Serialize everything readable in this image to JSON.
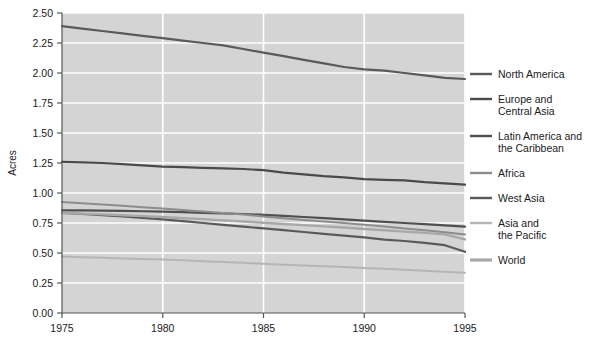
{
  "chart_data": {
    "type": "line",
    "title": "",
    "xlabel": "",
    "ylabel": "Acres",
    "xlim": [
      1975,
      1995
    ],
    "ylim": [
      0.0,
      2.5
    ],
    "grid": true,
    "legend_position": "right",
    "x": [
      1975,
      1976,
      1977,
      1978,
      1979,
      1980,
      1981,
      1982,
      1983,
      1984,
      1985,
      1986,
      1987,
      1988,
      1989,
      1990,
      1991,
      1992,
      1993,
      1994,
      1995
    ],
    "xticks": [
      "1975",
      "1980",
      "1985",
      "1990",
      "1995"
    ],
    "xtick_values": [
      1975,
      1980,
      1985,
      1990,
      1995
    ],
    "yticks": [
      "0.00",
      "0.25",
      "0.50",
      "0.75",
      "1.00",
      "1.25",
      "1.50",
      "1.75",
      "2.00",
      "2.25",
      "2.50"
    ],
    "ytick_values": [
      0.0,
      0.25,
      0.5,
      0.75,
      1.0,
      1.25,
      1.5,
      1.75,
      2.0,
      2.25,
      2.5
    ],
    "series": [
      {
        "name": "North America",
        "color": "#5a5a5a",
        "width": 2.2,
        "values": [
          2.39,
          2.37,
          2.35,
          2.33,
          2.31,
          2.29,
          2.27,
          2.25,
          2.23,
          2.2,
          2.17,
          2.14,
          2.11,
          2.08,
          2.05,
          2.03,
          2.02,
          2.0,
          1.98,
          1.96,
          1.95
        ]
      },
      {
        "name": "Europe and Central Asia",
        "color": "#4a4a4a",
        "width": 2.2,
        "values": [
          1.26,
          1.255,
          1.25,
          1.24,
          1.23,
          1.22,
          1.215,
          1.21,
          1.205,
          1.2,
          1.19,
          1.17,
          1.155,
          1.14,
          1.13,
          1.115,
          1.11,
          1.105,
          1.09,
          1.08,
          1.07
        ]
      },
      {
        "name": "Latin America and the Caribbean",
        "color": "#4f4f4f",
        "width": 2.2,
        "values": [
          0.855,
          0.855,
          0.853,
          0.851,
          0.848,
          0.845,
          0.84,
          0.835,
          0.83,
          0.825,
          0.818,
          0.81,
          0.8,
          0.79,
          0.78,
          0.77,
          0.76,
          0.75,
          0.74,
          0.73,
          0.72
        ]
      },
      {
        "name": "Africa",
        "color": "#8c8c8c",
        "width": 2.0,
        "values": [
          0.925,
          0.915,
          0.905,
          0.893,
          0.882,
          0.87,
          0.858,
          0.845,
          0.833,
          0.82,
          0.805,
          0.79,
          0.775,
          0.762,
          0.75,
          0.735,
          0.72,
          0.705,
          0.69,
          0.672,
          0.655
        ]
      },
      {
        "name": "West Asia",
        "color": "#5a5a5a",
        "width": 2.2,
        "values": [
          0.835,
          0.825,
          0.815,
          0.805,
          0.792,
          0.78,
          0.765,
          0.75,
          0.735,
          0.72,
          0.705,
          0.69,
          0.675,
          0.66,
          0.645,
          0.63,
          0.612,
          0.6,
          0.585,
          0.565,
          0.51
        ]
      },
      {
        "name": "Asia and the Pacific",
        "color": "#b5b5b5",
        "width": 2.0,
        "values": [
          0.47,
          0.465,
          0.46,
          0.455,
          0.45,
          0.445,
          0.44,
          0.432,
          0.425,
          0.418,
          0.41,
          0.402,
          0.395,
          0.39,
          0.383,
          0.375,
          0.368,
          0.36,
          0.352,
          0.344,
          0.335
        ]
      },
      {
        "name": "World",
        "color": "#a8a8a8",
        "width": 2.4,
        "values": [
          0.835,
          0.828,
          0.822,
          0.815,
          0.807,
          0.8,
          0.79,
          0.782,
          0.772,
          0.762,
          0.752,
          0.742,
          0.732,
          0.722,
          0.712,
          0.7,
          0.69,
          0.678,
          0.668,
          0.655,
          0.613
        ]
      }
    ]
  },
  "legend": {
    "items": [
      {
        "label_lines": [
          "North America"
        ],
        "color": "#5a5a5a"
      },
      {
        "label_lines": [
          "Europe and",
          "Central Asia"
        ],
        "color": "#4a4a4a"
      },
      {
        "label_lines": [
          "Latin America and",
          "the Caribbean"
        ],
        "color": "#4f4f4f"
      },
      {
        "label_lines": [
          "Africa"
        ],
        "color": "#8c8c8c"
      },
      {
        "label_lines": [
          "West Asia"
        ],
        "color": "#5a5a5a"
      },
      {
        "label_lines": [
          "Asia and",
          "the Pacific"
        ],
        "color": "#b5b5b5"
      },
      {
        "label_lines": [
          "World"
        ],
        "color": "#a8a8a8"
      }
    ]
  },
  "style": {
    "plot_background": "#d4d4d4",
    "grid_color": "#ffffff",
    "axis_color": "#555555",
    "page_background": "#ffffff",
    "text_color": "#1a1a1a"
  }
}
